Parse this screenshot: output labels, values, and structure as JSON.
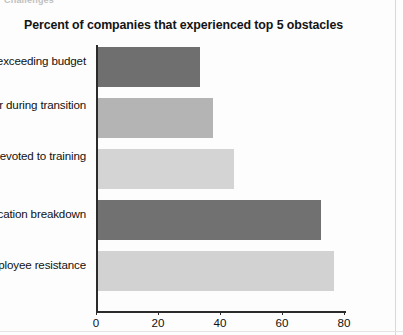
{
  "top_fragment": "Challenges",
  "chart_data": {
    "type": "bar",
    "orientation": "horizontal",
    "title": "Percent of companies that experienced top 5 obstacles",
    "xlabel": "",
    "ylabel": "",
    "xlim": [
      0,
      80
    ],
    "grid": false,
    "legend": "none",
    "categories": [
      "Costs exceeding budget",
      "Staff turnover during transition",
      "Insufficient time devoted to training",
      "Communication breakdown",
      "Employee resistance"
    ],
    "values": [
      33,
      37,
      44,
      72,
      76
    ],
    "bar_colors": [
      "#6f6f6f",
      "#b4b4b4",
      "#d4d4d4",
      "#717171",
      "#d2d2d2"
    ],
    "xticks": [
      0,
      20,
      40,
      60,
      80
    ],
    "xtick_labels": [
      "0",
      "20",
      "40",
      "60",
      "80"
    ]
  }
}
